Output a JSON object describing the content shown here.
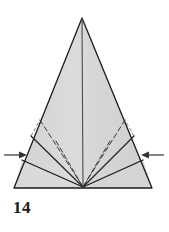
{
  "figure": {
    "kind": "origami-fold-diagram",
    "step_label": "14",
    "colors": {
      "paper_fill": "#d6d6d6",
      "paper_fill_light": "#dedede",
      "outline": "#1a1a1a",
      "crease_solid": "#2a2a2a",
      "crease_dashed": "#3a3a3a",
      "arrow": "#333333",
      "background": "#ffffff",
      "label": "#1b1b1b"
    },
    "geometry": {
      "apex": [
        82,
        18
      ],
      "bottom_left": [
        14,
        188
      ],
      "bottom_right": [
        152,
        188
      ],
      "converge_point": [
        83,
        187
      ],
      "left_edge_vertex": [
        31,
        136
      ],
      "right_edge_vertex": [
        134,
        136
      ],
      "left_flap_corner": [
        22,
        160
      ],
      "right_flap_corner": [
        143,
        160
      ]
    },
    "creases": {
      "center_vertical": {
        "style": "solid",
        "from": [
          82,
          18
        ],
        "to": [
          83,
          187
        ]
      },
      "left_solid_long": {
        "style": "solid",
        "from": [
          31,
          136
        ],
        "to": [
          83,
          187
        ]
      },
      "right_solid_long": {
        "style": "solid",
        "from": [
          134,
          136
        ],
        "to": [
          83,
          187
        ]
      },
      "left_flap_edge": {
        "style": "solid",
        "from": [
          22,
          160
        ],
        "to": [
          83,
          187
        ]
      },
      "right_flap_edge": {
        "style": "solid",
        "from": [
          143,
          160
        ],
        "to": [
          83,
          187
        ]
      },
      "left_dashed_1": {
        "style": "dashed",
        "from": [
          40,
          120
        ],
        "to": [
          83,
          187
        ]
      },
      "left_dashed_2": {
        "style": "dashed",
        "from": [
          55,
          140
        ],
        "to": [
          83,
          187
        ]
      },
      "right_dashed_1": {
        "style": "dashed",
        "from": [
          124,
          120
        ],
        "to": [
          83,
          187
        ]
      },
      "right_dashed_2": {
        "style": "dashed",
        "from": [
          110,
          140
        ],
        "to": [
          83,
          187
        ]
      }
    },
    "arrows": [
      {
        "name": "left-fold-arrow",
        "direction": "right",
        "label": "",
        "tail": [
          4,
          155
        ],
        "head": [
          26,
          155
        ]
      },
      {
        "name": "right-fold-arrow",
        "direction": "left",
        "label": "",
        "tail": [
          164,
          155
        ],
        "head": [
          142,
          155
        ]
      }
    ]
  }
}
